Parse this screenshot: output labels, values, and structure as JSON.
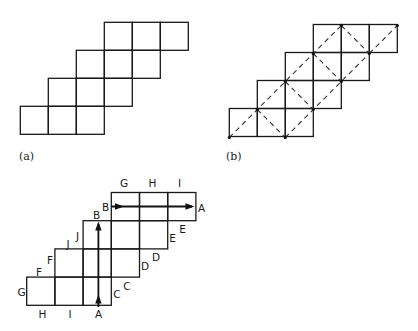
{
  "figure": {
    "panels": [
      {
        "id": "a",
        "label": "(a)",
        "description": "staircase net of 12 unit squares"
      },
      {
        "id": "b",
        "label": "(b)",
        "description": "same net with dashed diagonal fold lines"
      },
      {
        "id": "c",
        "label": "",
        "description": "net with edge identifications and arrows"
      }
    ],
    "panel_c_labels": {
      "top": [
        "G",
        "H",
        "I"
      ],
      "top_row_left": "B",
      "top_row_right": "A",
      "row2_left": "B",
      "row3_left_pair": [
        "J",
        "J"
      ],
      "row4_left_pair": [
        "F",
        "F"
      ],
      "bottom_left": "G",
      "bottom": [
        "H",
        "I",
        "A"
      ],
      "right_pairs": {
        "C": [
          "C",
          "C"
        ],
        "D": [
          "D",
          "D"
        ],
        "E": [
          "E",
          "E"
        ]
      }
    },
    "arrows": [
      {
        "name": "vertical-arrow",
        "from": "A",
        "to": "B",
        "direction": "up"
      },
      {
        "name": "horizontal-arrow",
        "from": "B",
        "to": "A",
        "direction": "right"
      }
    ],
    "colors": {
      "stroke": "#1a1a1a",
      "background": "#ffffff"
    }
  }
}
